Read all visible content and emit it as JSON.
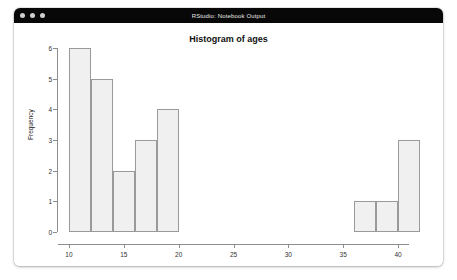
{
  "window": {
    "title": "RStudio: Notebook Output",
    "traffic_lights": [
      {
        "name": "close-button",
        "color": "#cfcfcf"
      },
      {
        "name": "minimize-button",
        "color": "#cfcfcf"
      },
      {
        "name": "zoom-button",
        "color": "#cfcfcf"
      }
    ],
    "titlebar_color": "#080808",
    "background": "#ffffff"
  },
  "chart_data": {
    "type": "bar",
    "title": "Histogram of ages",
    "xlabel": "ages",
    "ylabel": "Frequency",
    "xlim": [
      9,
      42
    ],
    "ylim": [
      0,
      6
    ],
    "xticks": [
      10,
      15,
      20,
      25,
      30,
      35,
      40
    ],
    "xtick_labels": [
      "10",
      "15",
      "20",
      "25",
      "30",
      "35",
      "40"
    ],
    "yticks": [
      0,
      1,
      2,
      3,
      4,
      5,
      6
    ],
    "ytick_labels": [
      "0",
      "1",
      "2",
      "3",
      "4",
      "5",
      "6"
    ],
    "grid": false,
    "legend": null,
    "bin_width": 2,
    "bar_fill": "#f0f0f0",
    "bar_edge": "#9a9a9a",
    "bins": [
      {
        "x0": 10,
        "x1": 12,
        "count": 6
      },
      {
        "x0": 12,
        "x1": 14,
        "count": 5
      },
      {
        "x0": 14,
        "x1": 16,
        "count": 2
      },
      {
        "x0": 16,
        "x1": 18,
        "count": 3
      },
      {
        "x0": 18,
        "x1": 20,
        "count": 4
      },
      {
        "x0": 20,
        "x1": 22,
        "count": 0
      },
      {
        "x0": 22,
        "x1": 24,
        "count": 0
      },
      {
        "x0": 24,
        "x1": 26,
        "count": 0
      },
      {
        "x0": 26,
        "x1": 28,
        "count": 0
      },
      {
        "x0": 28,
        "x1": 30,
        "count": 0
      },
      {
        "x0": 30,
        "x1": 32,
        "count": 0
      },
      {
        "x0": 32,
        "x1": 34,
        "count": 0
      },
      {
        "x0": 34,
        "x1": 36,
        "count": 0
      },
      {
        "x0": 36,
        "x1": 38,
        "count": 1
      },
      {
        "x0": 38,
        "x1": 40,
        "count": 1
      },
      {
        "x0": 40,
        "x1": 42,
        "count": 3
      }
    ],
    "categories": [
      "10-12",
      "12-14",
      "14-16",
      "16-18",
      "18-20",
      "20-22",
      "22-24",
      "24-26",
      "26-28",
      "28-30",
      "30-32",
      "32-34",
      "34-36",
      "36-38",
      "38-40",
      "40-42"
    ],
    "values": [
      6,
      5,
      2,
      3,
      4,
      0,
      0,
      0,
      0,
      0,
      0,
      0,
      0,
      1,
      1,
      3
    ]
  }
}
